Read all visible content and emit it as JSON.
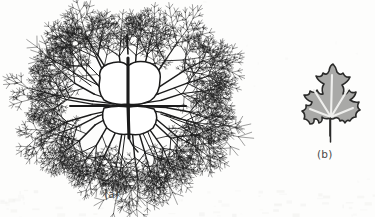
{
  "figure": {
    "kind": "scanned-scientific-figure",
    "background_color": "#fdfdfc",
    "panels": [
      {
        "id": "a",
        "label": "(a)",
        "caption_label": "(a)",
        "subject": "radial dendritic branching network",
        "description": "branching vein / fractal tree network radiating outward from a central cell structure",
        "line_color": "#1b1b1b",
        "fill_color": "#ffffff",
        "center_x": 120,
        "center_y": 100,
        "radius": 96,
        "branch_count": 26,
        "recursion_depth": 6
      },
      {
        "id": "b",
        "label": "(b)",
        "caption_label": "(b)",
        "subject": "lobed leaf silhouette",
        "description": "five-lobed maple / grape style leaf with petiole, gray fill and dark outline",
        "lobe_count": 5,
        "fill_color": "#a9a9a7",
        "outline_color": "#2a2a29",
        "vein_color": "#efefed",
        "has_petiole": true
      }
    ]
  },
  "labels": {
    "panel_a": "(a)",
    "panel_b": "(b)"
  },
  "colors": {
    "ink": "#1b1b1b",
    "paper": "#fdfdfc",
    "leaf_fill": "#a9a9a7",
    "leaf_outline": "#2a2a29",
    "leaf_vein": "#efefed",
    "label_text": "#4a4a48"
  }
}
